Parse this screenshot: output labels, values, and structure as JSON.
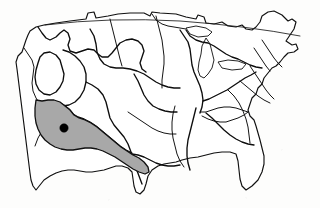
{
  "figure": {
    "kind": "map",
    "caption": "",
    "title": "",
    "width_px": 320,
    "height_px": 208,
    "background_color": "#fdfdfc",
    "has_text_labels": false,
    "has_legend": false,
    "has_scale_bar": false,
    "has_north_arrow": false,
    "has_graticule": false,
    "projection_appearance": "conic, curved northern border"
  },
  "styles": {
    "outline_color": "#101010",
    "basin_boundary_color": "#0d0d0d",
    "land_fill_color": "#ffffff",
    "highlight_fill_color": "#a8a8a8",
    "highlight_stroke_color": "#101010",
    "marker_color": "#000000",
    "national_border_color": "#1a1a1a",
    "coastline_stroke_width": 1.15,
    "basin_stroke_width": 1.35,
    "national_border_stroke_width": 0.85
  },
  "highlight": {
    "name": "highlighted-basin",
    "label": "",
    "region_description": "Lower Colorado River basin, southwestern United States",
    "fill_color": "#a8a8a8",
    "stroke_color": "#101010",
    "is_shaded": true
  },
  "site_marker": {
    "name": "study-site-marker",
    "label": "",
    "shape": "filled-circle",
    "color": "#000000",
    "radius_px": 4.2,
    "x_px": 64,
    "y_px": 128,
    "inside_highlighted_basin": true
  },
  "features": {
    "coastline_name": "us-coastline",
    "northern_border_name": "us-canada-border",
    "basin_network_name": "river-basin-boundaries",
    "great_lakes_name": "great-lakes-outline",
    "basin_boundary_count_visible": 18
  },
  "chart_data": {
    "type": "map",
    "title": "",
    "regions": [
      {
        "id": "pacific-northwest",
        "shaded": false
      },
      {
        "id": "california",
        "shaded": false
      },
      {
        "id": "great-basin",
        "shaded": false
      },
      {
        "id": "upper-colorado",
        "shaded": false
      },
      {
        "id": "lower-colorado",
        "shaded": true
      },
      {
        "id": "rio-grande",
        "shaded": false
      },
      {
        "id": "missouri",
        "shaded": false
      },
      {
        "id": "arkansas-white-red",
        "shaded": false
      },
      {
        "id": "texas-gulf",
        "shaded": false
      },
      {
        "id": "upper-mississippi",
        "shaded": false
      },
      {
        "id": "lower-mississippi",
        "shaded": false
      },
      {
        "id": "ohio",
        "shaded": false
      },
      {
        "id": "tennessee",
        "shaded": false
      },
      {
        "id": "great-lakes",
        "shaded": false
      },
      {
        "id": "souris-red-rainy",
        "shaded": false
      },
      {
        "id": "mid-atlantic",
        "shaded": false
      },
      {
        "id": "new-england",
        "shaded": false
      },
      {
        "id": "south-atlantic-gulf",
        "shaded": false
      }
    ],
    "markers": [
      {
        "id": "study-site",
        "x": 64,
        "y": 128,
        "region": "lower-colorado"
      }
    ],
    "shaded_count": 1,
    "marker_count": 1
  }
}
